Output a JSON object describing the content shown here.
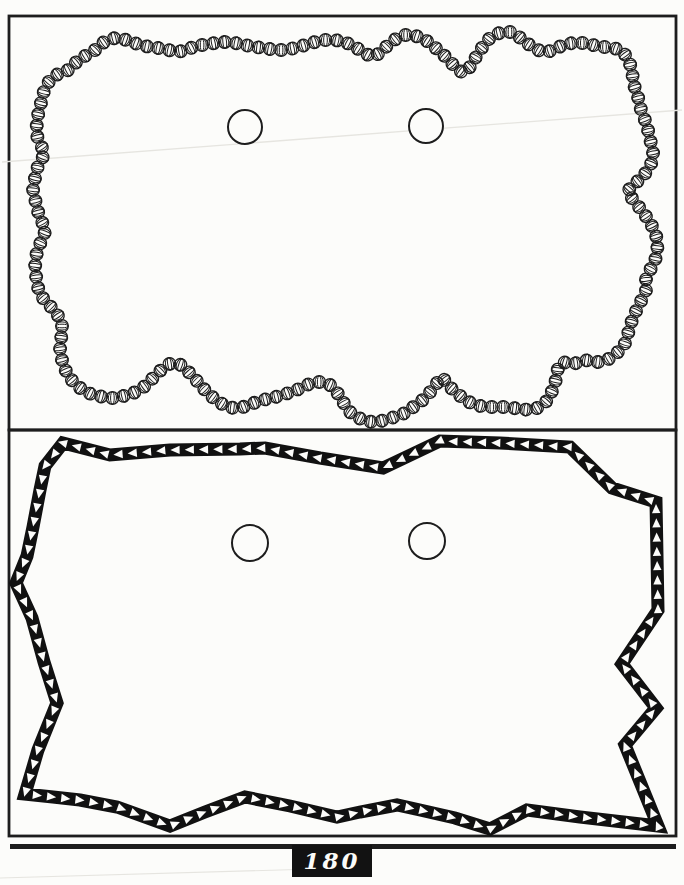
{
  "colors": {
    "paper": "#fcfcfa",
    "ink": "#1d1d1d",
    "band": "#111111",
    "artifact": "#e6e5e0"
  },
  "footer": {
    "page_number": "180"
  },
  "top_panel": {
    "frame": {
      "x": 9,
      "y": 16,
      "w": 667,
      "h": 414
    },
    "bead_radius": 6.3,
    "bead_pitch": 11.4,
    "holes": [
      {
        "cx": 245,
        "cy": 127,
        "r": 17
      },
      {
        "cx": 426,
        "cy": 126,
        "r": 17
      }
    ],
    "outline": [
      [
        95,
        50
      ],
      [
        100,
        45
      ],
      [
        107,
        40
      ],
      [
        115,
        38
      ],
      [
        123,
        39
      ],
      [
        132,
        42
      ],
      [
        140,
        45
      ],
      [
        150,
        47
      ],
      [
        158,
        48
      ],
      [
        168,
        50
      ],
      [
        177,
        52
      ],
      [
        187,
        50
      ],
      [
        197,
        45
      ],
      [
        205,
        45
      ],
      [
        215,
        43
      ],
      [
        225,
        42
      ],
      [
        235,
        43
      ],
      [
        245,
        45
      ],
      [
        255,
        47
      ],
      [
        265,
        48
      ],
      [
        275,
        50
      ],
      [
        285,
        50
      ],
      [
        295,
        48
      ],
      [
        305,
        45
      ],
      [
        315,
        42
      ],
      [
        325,
        40
      ],
      [
        335,
        40
      ],
      [
        345,
        42
      ],
      [
        355,
        47
      ],
      [
        363,
        52
      ],
      [
        372,
        57
      ],
      [
        380,
        53
      ],
      [
        388,
        45
      ],
      [
        397,
        38
      ],
      [
        405,
        35
      ],
      [
        413,
        35
      ],
      [
        422,
        38
      ],
      [
        430,
        43
      ],
      [
        438,
        50
      ],
      [
        447,
        58
      ],
      [
        455,
        67
      ],
      [
        463,
        73
      ],
      [
        470,
        67
      ],
      [
        476,
        57
      ],
      [
        481,
        49
      ],
      [
        489,
        39
      ],
      [
        496,
        34
      ],
      [
        504,
        32
      ],
      [
        511,
        32
      ],
      [
        518,
        36
      ],
      [
        525,
        42
      ],
      [
        533,
        47
      ],
      [
        540,
        51
      ],
      [
        547,
        52
      ],
      [
        553,
        50
      ],
      [
        559,
        47
      ],
      [
        566,
        44
      ],
      [
        573,
        43
      ],
      [
        580,
        43
      ],
      [
        587,
        43
      ],
      [
        593,
        45
      ],
      [
        599,
        47
      ],
      [
        605,
        47
      ],
      [
        611,
        47
      ],
      [
        617,
        49
      ],
      [
        623,
        52
      ],
      [
        629,
        60
      ],
      [
        632,
        72
      ],
      [
        634,
        85
      ],
      [
        638,
        97
      ],
      [
        641,
        110
      ],
      [
        645,
        120
      ],
      [
        648,
        130
      ],
      [
        651,
        143
      ],
      [
        654,
        157
      ],
      [
        650,
        166
      ],
      [
        643,
        177
      ],
      [
        634,
        184
      ],
      [
        627,
        192
      ],
      [
        635,
        202
      ],
      [
        643,
        212
      ],
      [
        650,
        222
      ],
      [
        655,
        232
      ],
      [
        658,
        242
      ],
      [
        657,
        252
      ],
      [
        655,
        261
      ],
      [
        650,
        270
      ],
      [
        646,
        279
      ],
      [
        647,
        288
      ],
      [
        643,
        297
      ],
      [
        638,
        307
      ],
      [
        633,
        317
      ],
      [
        630,
        327
      ],
      [
        627,
        337
      ],
      [
        624,
        346
      ],
      [
        618,
        352
      ],
      [
        612,
        357
      ],
      [
        605,
        361
      ],
      [
        598,
        362
      ],
      [
        591,
        361
      ],
      [
        584,
        360
      ],
      [
        577,
        363
      ],
      [
        570,
        364
      ],
      [
        563,
        362
      ],
      [
        558,
        367
      ],
      [
        557,
        375
      ],
      [
        555,
        383
      ],
      [
        552,
        391
      ],
      [
        549,
        398
      ],
      [
        544,
        404
      ],
      [
        537,
        408
      ],
      [
        529,
        410
      ],
      [
        521,
        409
      ],
      [
        513,
        408
      ],
      [
        505,
        407
      ],
      [
        497,
        407
      ],
      [
        489,
        407
      ],
      [
        481,
        406
      ],
      [
        473,
        404
      ],
      [
        465,
        400
      ],
      [
        458,
        394
      ],
      [
        451,
        388
      ],
      [
        446,
        382
      ],
      [
        442,
        377
      ],
      [
        437,
        383
      ],
      [
        431,
        391
      ],
      [
        425,
        398
      ],
      [
        419,
        403
      ],
      [
        412,
        408
      ],
      [
        405,
        413
      ],
      [
        397,
        416
      ],
      [
        389,
        419
      ],
      [
        381,
        421
      ],
      [
        373,
        422
      ],
      [
        365,
        421
      ],
      [
        357,
        417
      ],
      [
        350,
        412
      ],
      [
        345,
        405
      ],
      [
        341,
        398
      ],
      [
        336,
        391
      ],
      [
        330,
        385
      ],
      [
        323,
        382
      ],
      [
        315,
        382
      ],
      [
        307,
        385
      ],
      [
        299,
        389
      ],
      [
        291,
        392
      ],
      [
        283,
        395
      ],
      [
        275,
        397
      ],
      [
        267,
        399
      ],
      [
        259,
        401
      ],
      [
        251,
        404
      ],
      [
        243,
        407
      ],
      [
        235,
        408
      ],
      [
        227,
        407
      ],
      [
        219,
        402
      ],
      [
        211,
        396
      ],
      [
        204,
        389
      ],
      [
        198,
        382
      ],
      [
        192,
        376
      ],
      [
        187,
        370
      ],
      [
        181,
        365
      ],
      [
        175,
        363
      ],
      [
        169,
        364
      ],
      [
        163,
        368
      ],
      [
        157,
        374
      ],
      [
        151,
        380
      ],
      [
        145,
        386
      ],
      [
        138,
        391
      ],
      [
        131,
        394
      ],
      [
        123,
        396
      ],
      [
        115,
        398
      ],
      [
        107,
        398
      ],
      [
        99,
        396
      ],
      [
        91,
        394
      ],
      [
        83,
        390
      ],
      [
        76,
        385
      ],
      [
        70,
        378
      ],
      [
        66,
        371
      ],
      [
        63,
        364
      ],
      [
        61,
        356
      ],
      [
        60,
        348
      ],
      [
        61,
        340
      ],
      [
        62,
        332
      ],
      [
        62,
        324
      ],
      [
        59,
        317
      ],
      [
        54,
        310
      ],
      [
        48,
        304
      ],
      [
        43,
        298
      ],
      [
        39,
        291
      ],
      [
        37,
        283
      ],
      [
        36,
        275
      ],
      [
        35,
        267
      ],
      [
        36,
        259
      ],
      [
        37,
        251
      ],
      [
        40,
        244
      ],
      [
        43,
        237
      ],
      [
        46,
        229
      ],
      [
        42,
        222
      ],
      [
        39,
        215
      ],
      [
        37,
        207
      ],
      [
        35,
        199
      ],
      [
        33,
        191
      ],
      [
        34,
        182
      ],
      [
        36,
        174
      ],
      [
        38,
        166
      ],
      [
        42,
        159
      ],
      [
        45,
        152
      ],
      [
        41,
        146
      ],
      [
        38,
        139
      ],
      [
        36,
        131
      ],
      [
        37,
        123
      ],
      [
        38,
        115
      ],
      [
        40,
        107
      ],
      [
        42,
        99
      ],
      [
        44,
        91
      ],
      [
        47,
        84
      ],
      [
        52,
        78
      ],
      [
        58,
        74
      ],
      [
        64,
        72
      ],
      [
        70,
        69
      ],
      [
        74,
        64
      ],
      [
        79,
        60
      ],
      [
        85,
        56
      ],
      [
        90,
        53
      ]
    ],
    "artifact_line": {
      "x1": 2,
      "y1": 162,
      "x2": 682,
      "y2": 110
    }
  },
  "bottom_panel": {
    "frame": {
      "x": 9,
      "y": 430,
      "w": 667,
      "h": 406
    },
    "band_thickness": 13,
    "triangle_pitch": 14.3,
    "triangle": {
      "tip": -5.2,
      "base": 4,
      "half": 4.2
    },
    "holes": [
      {
        "cx": 250,
        "cy": 543,
        "r": 18
      },
      {
        "cx": 427,
        "cy": 541,
        "r": 18
      }
    ],
    "outline": [
      [
        63,
        443
      ],
      [
        110,
        455
      ],
      [
        170,
        450
      ],
      [
        240,
        449
      ],
      [
        265,
        448
      ],
      [
        320,
        458
      ],
      [
        383,
        468
      ],
      [
        440,
        441
      ],
      [
        500,
        443
      ],
      [
        570,
        447
      ],
      [
        612,
        488
      ],
      [
        656,
        502
      ],
      [
        658,
        610
      ],
      [
        622,
        664
      ],
      [
        656,
        708
      ],
      [
        625,
        745
      ],
      [
        658,
        826
      ],
      [
        580,
        817
      ],
      [
        527,
        810
      ],
      [
        490,
        829
      ],
      [
        455,
        818
      ],
      [
        420,
        810
      ],
      [
        397,
        805
      ],
      [
        360,
        812
      ],
      [
        337,
        817
      ],
      [
        290,
        806
      ],
      [
        245,
        797
      ],
      [
        205,
        812
      ],
      [
        170,
        826
      ],
      [
        117,
        807
      ],
      [
        80,
        800
      ],
      [
        53,
        797
      ],
      [
        25,
        794
      ],
      [
        38,
        750
      ],
      [
        57,
        703
      ],
      [
        44,
        662
      ],
      [
        32,
        618
      ],
      [
        16,
        583
      ],
      [
        27,
        556
      ],
      [
        33,
        527
      ],
      [
        40,
        490
      ],
      [
        45,
        466
      ]
    ]
  },
  "footer_rule": {
    "x": 10,
    "y": 844,
    "w": 666,
    "h": 5
  },
  "footer_artifact_line": {
    "x1": 0,
    "y1": 878,
    "x2": 350,
    "y2": 868
  }
}
